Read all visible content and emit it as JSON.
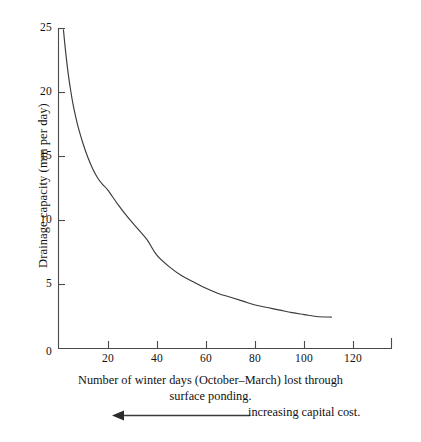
{
  "chart_data": {
    "type": "line",
    "title": "",
    "xlabel": "Number of winter days (October–March) lost through surface ponding.",
    "xlabel_line1": "Number of winter days (October–March) lost through",
    "xlabel_line2": "surface ponding.",
    "ylabel": "Drainage capacity (mm per day)",
    "xlim": [
      0,
      136
    ],
    "ylim": [
      0,
      25
    ],
    "grid": false,
    "legend": false,
    "line_color": "#3a3a3a",
    "axis_color": "#4a4a4a",
    "xticks": [
      0,
      20,
      40,
      60,
      80,
      100,
      120
    ],
    "yticks": [
      0,
      5,
      10,
      15,
      20,
      25
    ],
    "xtick_labels": [
      "0",
      "20",
      "40",
      "60",
      "80",
      "100",
      "120"
    ],
    "ytick_labels": [
      "0",
      "5",
      "10",
      "15",
      "20",
      "25"
    ],
    "series": [
      {
        "name": "Drainage capacity vs winter days lost",
        "x": [
          2.0,
          3.0,
          4.0,
          5.0,
          6.0,
          7.0,
          8.0,
          10.0,
          12.0,
          14.0,
          16.0,
          18.0,
          20.0,
          24.0,
          28.0,
          32.0,
          36.0,
          40.0,
          45.0,
          50.0,
          55.0,
          60.0,
          65.0,
          70.0,
          75.0,
          80.0,
          85.0,
          90.0,
          95.0,
          100.0,
          105.0,
          111.0
        ],
        "y": [
          24.9,
          23.0,
          21.4,
          20.1,
          19.0,
          18.1,
          17.3,
          16.0,
          14.9,
          14.0,
          13.3,
          12.8,
          12.4,
          11.3,
          10.3,
          9.4,
          8.5,
          7.3,
          6.4,
          5.7,
          5.2,
          4.7,
          4.3,
          4.0,
          3.7,
          3.4,
          3.2,
          3.0,
          2.8,
          2.65,
          2.5,
          2.45
        ]
      }
    ],
    "annotation": {
      "text": "increasing capital cost.",
      "arrow_direction": "left",
      "icon": "left-arrow-icon"
    }
  },
  "axis": {
    "y_title": "Drainage capacity (mm per day)",
    "x_caption_line1": "Number of winter days (October–March) lost through",
    "x_caption_line2": "surface ponding."
  }
}
